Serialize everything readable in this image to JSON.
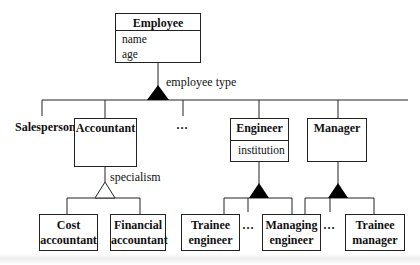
{
  "diagram": {
    "root": {
      "name": "Employee",
      "attributes": [
        "name",
        "age"
      ]
    },
    "discriminator_top": "employee type",
    "level1": {
      "salesperson": "Salesperson",
      "accountant": "Accountant",
      "ellipsis": "…",
      "engineer": {
        "name": "Engineer",
        "attributes": [
          "institution"
        ]
      },
      "manager": "Manager"
    },
    "discriminator_accountant": "specialism",
    "level2": {
      "cost_accountant": [
        "Cost",
        "accountant"
      ],
      "financial_accountant": [
        "Financial",
        "accountant"
      ],
      "trainee_engineer": [
        "Trainee",
        "engineer"
      ],
      "engineer_ellipsis": "…",
      "managing_engineer": [
        "Managing",
        "engineer"
      ],
      "manager_ellipsis": "…",
      "trainee_manager": [
        "Trainee",
        "manager"
      ]
    }
  }
}
